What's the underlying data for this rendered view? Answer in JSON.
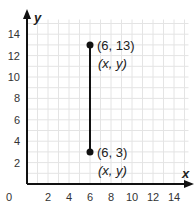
{
  "chart_data": {
    "type": "scatter",
    "title": "",
    "xlabel": "x",
    "ylabel": "y",
    "xlim": [
      0,
      15
    ],
    "ylim": [
      0,
      15
    ],
    "grid": true,
    "grid_step": 1,
    "x_ticks": [
      2,
      4,
      6,
      8,
      10,
      12,
      14
    ],
    "y_ticks": [
      2,
      4,
      6,
      8,
      10,
      12,
      14
    ],
    "origin_label": "0",
    "points": [
      {
        "x": 6,
        "y": 13,
        "label": "(6, 13)",
        "sublabel": "(x, y)"
      },
      {
        "x": 6,
        "y": 3,
        "label": "(6, 3)",
        "sublabel": "(x, y)"
      }
    ],
    "segments": [
      {
        "from": [
          6,
          3
        ],
        "to": [
          6,
          13
        ]
      }
    ],
    "colors": {
      "axis": "#111111",
      "grid": "#e4e4e4",
      "point": "#111111",
      "text": "#222222"
    }
  }
}
